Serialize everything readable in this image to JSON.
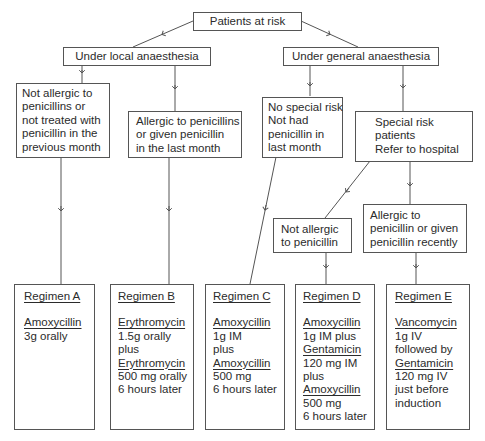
{
  "diagram": {
    "root": {
      "label": "Patients at risk"
    },
    "branches": [
      {
        "label": "Under local anaesthesia"
      },
      {
        "label": "Under general anaesthesia"
      }
    ],
    "conditions": {
      "local_not_allergic": [
        "Not allergic to",
        "penicillins or",
        "not treated with",
        "penicillin in the",
        "previous month"
      ],
      "local_allergic": [
        "Allergic to penicillins",
        "or given penicillin",
        "in the last month"
      ],
      "general_no_risk": [
        "No special risk",
        "Not had",
        "penicillin in",
        "last month"
      ],
      "general_special": [
        "Special risk",
        "patients",
        "Refer to hospital"
      ],
      "special_not_allergic": [
        "Not allergic",
        "to penicillin"
      ],
      "special_allergic": [
        "Allergic to",
        "penicillin or given",
        "penicillin recently"
      ]
    },
    "regimens": [
      {
        "title": "Regimen A",
        "lines": [
          {
            "text": "Amoxycillin",
            "drug": true
          },
          {
            "text": "3g orally",
            "drug": false
          }
        ]
      },
      {
        "title": "Regimen B",
        "lines": [
          {
            "text": "Erythromycin",
            "drug": true
          },
          {
            "text": "1.5g orally",
            "drug": false
          },
          {
            "text": "plus",
            "drug": false
          },
          {
            "text": "Erythromycin",
            "drug": true
          },
          {
            "text": "500 mg orally",
            "drug": false
          },
          {
            "text": "6 hours later",
            "drug": false
          }
        ]
      },
      {
        "title": "Regimen C",
        "lines": [
          {
            "text": "Amoxycillin",
            "drug": true
          },
          {
            "text": "1g IM",
            "drug": false
          },
          {
            "text": "plus",
            "drug": false
          },
          {
            "text": "Amoxycillin",
            "drug": true
          },
          {
            "text": "500 mg",
            "drug": false
          },
          {
            "text": "6 hours later",
            "drug": false
          }
        ]
      },
      {
        "title": "Regimen D",
        "lines": [
          {
            "text": "Amoxycillin",
            "drug": true
          },
          {
            "text": "1g IM plus",
            "drug": false
          },
          {
            "text": "Gentamicin",
            "drug": true
          },
          {
            "text": "120 mg IM",
            "drug": false
          },
          {
            "text": "plus",
            "drug": false
          },
          {
            "text": "Amoxycillin",
            "drug": true
          },
          {
            "text": "500 mg",
            "drug": false
          },
          {
            "text": "6 hours later",
            "drug": false
          }
        ]
      },
      {
        "title": "Regimen E",
        "lines": [
          {
            "text": "Vancomycin",
            "drug": true
          },
          {
            "text": "1g IV",
            "drug": false
          },
          {
            "text": "followed by",
            "drug": false
          },
          {
            "text": "Gentamicin",
            "drug": true
          },
          {
            "text": "120 mg IV",
            "drug": false
          },
          {
            "text": "just before",
            "drug": false
          },
          {
            "text": "induction",
            "drug": false
          }
        ]
      }
    ],
    "colors": {
      "line": "#555555",
      "text": "#2b2b2b",
      "background": "#ffffff"
    }
  }
}
